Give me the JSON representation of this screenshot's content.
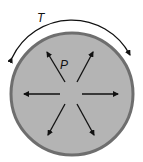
{
  "diagram": {
    "tension_label": "T",
    "pressure_label": "P",
    "colors": {
      "fill": "#b4b4b4",
      "border": "#6e6e6e",
      "arrow": "#111111"
    },
    "arrows": [
      "up-left",
      "up-right",
      "left",
      "right",
      "down-left",
      "down-right"
    ]
  }
}
